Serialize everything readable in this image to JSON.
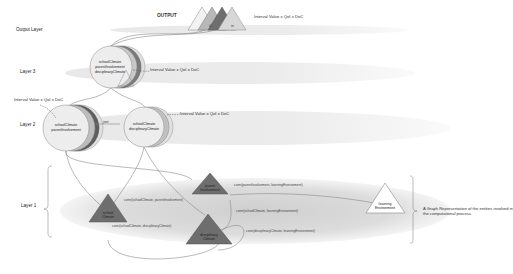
{
  "output": {
    "title": "OUTPUT",
    "formula": "Interval Value x QoI x DoC",
    "t1": "t1",
    "tn": "tn"
  },
  "layers": {
    "output": "Output Layer",
    "layer3": "Layer 3",
    "layer2": "Layer 2",
    "layer1": "Layer 1"
  },
  "layer3": {
    "node_lines": [
      "schoolClimate",
      "parentInvolvement",
      "disciplinaryClimate"
    ],
    "formula": "Interval Value x QoI x DoC"
  },
  "layer2": {
    "formula_left": "Interval Value x QoI x DoC",
    "formula_right": "Interval Value x QoI x DoC",
    "node_a_lines": [
      "schoolClimate",
      "parentInvolvement"
    ],
    "node_b_lines": [
      "schoolClimate",
      "disciplinaryClimate"
    ],
    "link_label": "joint"
  },
  "layer1": {
    "nodes": {
      "school_climate": [
        "school",
        "Climate"
      ],
      "parent_involvement": [
        "parent",
        "Involvement"
      ],
      "disciplinary_climate": [
        "disciplinary",
        "Climate"
      ],
      "learning_environment": [
        "learning",
        "Environment"
      ]
    },
    "edges": {
      "school_parent": "conn(schoolClimate, parentInvolvement)",
      "school_disciplinary": "conn(schoolClimate, disciplinaryClimate)",
      "parent_learning": "conn(parentInvolvement, learningEnvironment)",
      "school_learning": "conn(schoolClimate, learningEnvironment)",
      "disciplinary_learning": "conn(disciplinaryClimate, learningEnvironment)"
    }
  },
  "caption": "A Graph Representation of the entities involved in the computational process.",
  "colors": {
    "triangle_dark": "#6e6e6e",
    "triangle_light": "#ffffff",
    "ellipse_fill": "#d6d6d6",
    "circle_fill": "#ededed",
    "line": "#888888"
  }
}
